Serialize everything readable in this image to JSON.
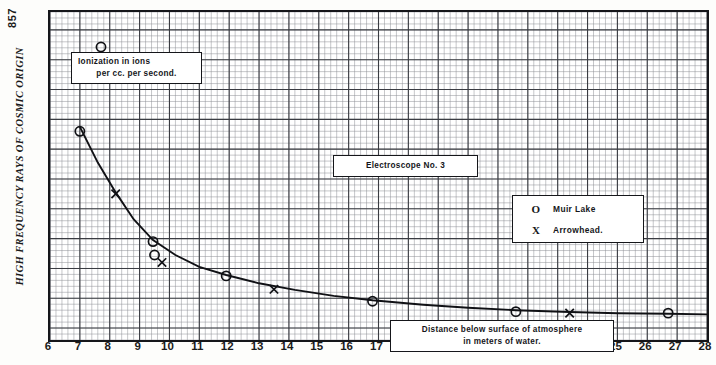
{
  "page_number": "857",
  "y_axis_title": "HIGH FREQUENCY RAYS OF COSMIC ORIGIN",
  "annotations": {
    "ionization_line1": "Ionization in ions",
    "ionization_line2": "per cc. per second.",
    "electroscope": "Electroscope No. 3",
    "distance_line1": "Distance below surface of atmosphere",
    "distance_line2": "in meters of water."
  },
  "legend": {
    "entries": [
      {
        "symbol": "O",
        "label": "Muir Lake"
      },
      {
        "symbol": "X",
        "label": "Arrowhead."
      }
    ]
  },
  "chart_data": {
    "type": "scatter",
    "title": "Electroscope No. 3",
    "xlabel": "Distance below surface of atmosphere in meters of water.",
    "ylabel": "Ionization in ions per cc. per second.",
    "xlim": [
      6,
      28
    ],
    "ylim": [
      2.6,
      13.6
    ],
    "grid": true,
    "legend_position": "upper-right",
    "xticks": [
      6,
      7,
      8,
      9,
      10,
      11,
      12,
      13,
      14,
      15,
      16,
      17,
      18,
      19,
      20,
      21,
      22,
      23,
      24,
      25,
      26,
      27,
      28
    ],
    "yticks": [
      3,
      4,
      5,
      6,
      7,
      8,
      9,
      10,
      11,
      12,
      13
    ],
    "series": [
      {
        "name": "Muir Lake",
        "marker": "circle",
        "points": [
          {
            "x": 7.0,
            "y": 9.6
          },
          {
            "x": 9.45,
            "y": 5.9
          },
          {
            "x": 9.5,
            "y": 5.45
          },
          {
            "x": 11.9,
            "y": 4.75
          },
          {
            "x": 16.8,
            "y": 3.9
          },
          {
            "x": 21.6,
            "y": 3.55
          },
          {
            "x": 26.7,
            "y": 3.5
          }
        ]
      },
      {
        "name": "Arrowhead.",
        "marker": "cross",
        "points": [
          {
            "x": 8.2,
            "y": 7.5
          },
          {
            "x": 9.75,
            "y": 5.2
          },
          {
            "x": 13.5,
            "y": 4.3
          },
          {
            "x": 23.4,
            "y": 3.5
          }
        ]
      },
      {
        "name": "fitted curve",
        "marker": "line",
        "points": [
          {
            "x": 7.0,
            "y": 9.75
          },
          {
            "x": 7.6,
            "y": 8.55
          },
          {
            "x": 8.2,
            "y": 7.55
          },
          {
            "x": 8.8,
            "y": 6.65
          },
          {
            "x": 9.45,
            "y": 5.95
          },
          {
            "x": 10.2,
            "y": 5.45
          },
          {
            "x": 11.0,
            "y": 5.05
          },
          {
            "x": 11.9,
            "y": 4.78
          },
          {
            "x": 13.0,
            "y": 4.5
          },
          {
            "x": 14.2,
            "y": 4.28
          },
          {
            "x": 15.5,
            "y": 4.08
          },
          {
            "x": 16.8,
            "y": 3.93
          },
          {
            "x": 18.5,
            "y": 3.78
          },
          {
            "x": 20.0,
            "y": 3.68
          },
          {
            "x": 21.6,
            "y": 3.6
          },
          {
            "x": 23.4,
            "y": 3.54
          },
          {
            "x": 25.0,
            "y": 3.5
          },
          {
            "x": 26.7,
            "y": 3.48
          },
          {
            "x": 28.0,
            "y": 3.46
          }
        ]
      }
    ]
  }
}
